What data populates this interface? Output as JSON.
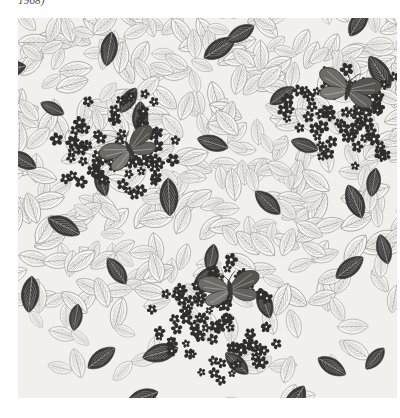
{
  "caption": {
    "text": "1968)",
    "note": "clipped caption line at top edge of plate, only descenders visible"
  },
  "plate": {
    "background_color": "#ffffff",
    "swatch_background_color": "#f2f0ec",
    "swatch_left": 18,
    "swatch_top": 18,
    "swatch_width": 379,
    "swatch_height": 380
  },
  "palette": {
    "ground": "#f2f0ec",
    "outline_ink": "#8d8b86",
    "outline_ink_dark": "#6e6c68",
    "vein_ink": "#a8a6a1",
    "solid_leaf": "#3a3a38",
    "solid_leaf_mid": "#55534f",
    "blossom_ink": "#2f2e2c",
    "moth_body": "#4b4946",
    "moth_wing": "#6d6b66"
  },
  "pattern": {
    "name": "leaf-and-blossom repeating textile design",
    "ground_description": "densely overlapping outlined leaves with central midrib and lateral veins",
    "motifs": [
      "outlined leaf",
      "solid dark leaf",
      "five-petal blossom cluster",
      "moth"
    ],
    "outlined_leaf_count": 320,
    "solid_leaf_count": 34,
    "blossom_cluster_count": 3,
    "moth_count": 3
  },
  "blossom_clusters": [
    {
      "name": "upper-left-cluster",
      "cx": 98,
      "cy": 128,
      "rx": 62,
      "ry": 58,
      "blossom_count": 78
    },
    {
      "name": "upper-right-cluster",
      "cx": 330,
      "cy": 98,
      "rx": 66,
      "ry": 56,
      "blossom_count": 74
    },
    {
      "name": "bottom-center-cluster",
      "cx": 205,
      "cy": 302,
      "rx": 70,
      "ry": 58,
      "blossom_count": 86
    }
  ],
  "moths": [
    {
      "name": "moth-upper-left",
      "cx": 112,
      "cy": 132,
      "angle": -28
    },
    {
      "name": "moth-upper-right",
      "cx": 330,
      "cy": 72,
      "angle": 14
    },
    {
      "name": "moth-bottom-center",
      "cx": 212,
      "cy": 272,
      "angle": -8
    }
  ],
  "chart_data": {
    "type": "table",
    "categories": [
      "outlined leaf",
      "solid dark leaf",
      "blossom cluster",
      "moth"
    ],
    "values": [
      320,
      34,
      3,
      3
    ],
    "xlabel": "motif",
    "ylabel": "count"
  }
}
